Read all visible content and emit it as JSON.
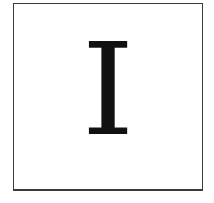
{
  "card": {
    "letter": "I"
  },
  "colors": {
    "border": "#3a3a3a",
    "letter": "#111111",
    "background": "#ffffff"
  }
}
